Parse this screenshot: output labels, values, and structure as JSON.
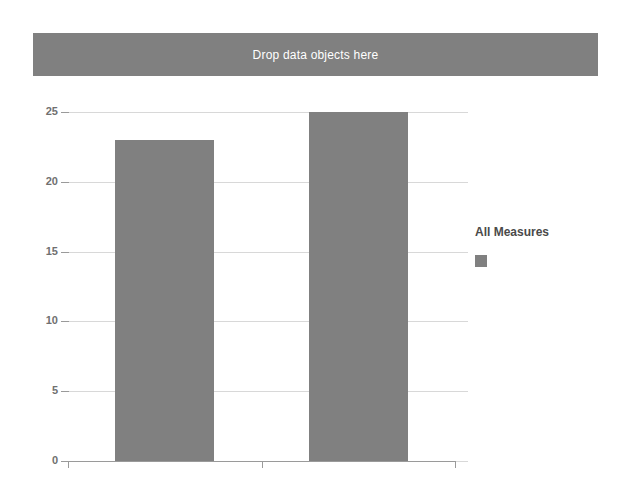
{
  "dropzone": {
    "label": "Drop data objects here",
    "fill_color": "#808080",
    "text_color": "#ffffff"
  },
  "legend": {
    "title": "All Measures",
    "entries": [
      {
        "label": "",
        "swatch_color": "#808080",
        "swatch_name": "legend-swatch-all-measures"
      }
    ]
  },
  "chart_data": {
    "type": "bar",
    "title": "",
    "subtitle": "",
    "xlabel": "",
    "ylabel": "",
    "categories": [
      "",
      ""
    ],
    "values": [
      23,
      25
    ],
    "series": [
      {
        "name": "All Measures",
        "values": [
          23,
          25
        ],
        "color": "#808080"
      }
    ],
    "ylim": [
      0,
      25
    ],
    "yticks": [
      0,
      5,
      10,
      15,
      20,
      25
    ],
    "ytick_labels": [
      "0",
      "5",
      "10",
      "15",
      "20",
      "25"
    ],
    "xticks": [],
    "xtick_labels": [],
    "grid": true,
    "grid_axis": "y",
    "grid_color": "#d8d8d8",
    "axis_color": "#9a9a9a",
    "legend_position": "right",
    "background": "#ffffff"
  }
}
